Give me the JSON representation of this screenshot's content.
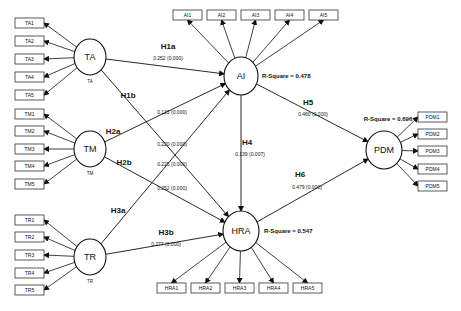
{
  "diagram": {
    "type": "structural-equation-model",
    "constructs": [
      {
        "id": "TA",
        "label": "TA",
        "sublabel": "TA",
        "cx": 90,
        "cy": 57,
        "rx": 16,
        "ry": 18
      },
      {
        "id": "TM",
        "label": "TM",
        "sublabel": "TM",
        "cx": 90,
        "cy": 149,
        "rx": 16,
        "ry": 18
      },
      {
        "id": "TR",
        "label": "TR",
        "sublabel": "TR",
        "cx": 90,
        "cy": 257,
        "rx": 16,
        "ry": 18
      },
      {
        "id": "AI",
        "label": "AI",
        "sublabel": "",
        "cx": 241,
        "cy": 76,
        "rx": 17,
        "ry": 19,
        "r_square": "R-Square = 0.478"
      },
      {
        "id": "HRA",
        "label": "HRA",
        "sublabel": "",
        "cx": 241,
        "cy": 231,
        "rx": 18,
        "ry": 20,
        "r_square": "R-Square = 0.547"
      },
      {
        "id": "PDM",
        "label": "PDM",
        "sublabel": "",
        "cx": 384,
        "cy": 150,
        "rx": 18,
        "ry": 19,
        "r_square": "R-Square = 0.696"
      }
    ],
    "indicators": {
      "TA": [
        "TA1",
        "TA2",
        "TA3",
        "TA4",
        "TA5"
      ],
      "TM": [
        "TM1",
        "TM2",
        "TM3",
        "TM4",
        "TM5"
      ],
      "TR": [
        "TR1",
        "TR2",
        "TR3",
        "TR4",
        "TR5"
      ],
      "AI": [
        "AI1",
        "AI2",
        "AI3",
        "AI4",
        "AI5"
      ],
      "HRA": [
        "HRA1",
        "HRA2",
        "HRA3",
        "HRA4",
        "HRA5"
      ],
      "PDM": [
        "PDM1",
        "PDM2",
        "PDM3",
        "PDM4",
        "PDM5"
      ]
    },
    "paths": [
      {
        "id": "H1a",
        "from": "TA",
        "to": "AI",
        "label": "H1a",
        "coef": "0.252 (0.000)"
      },
      {
        "id": "H1b",
        "from": "TA",
        "to": "HRA",
        "label": "H1b",
        "coef": "0.220 (0.000)"
      },
      {
        "id": "H2a",
        "from": "TM",
        "to": "AI",
        "label": "H2a",
        "coef": "0.133 (0.000)"
      },
      {
        "id": "H2b",
        "from": "TM",
        "to": "HRA",
        "label": "H2b",
        "coef": "0.252 (0.000)"
      },
      {
        "id": "H3a",
        "from": "TR",
        "to": "AI",
        "label": "H3a",
        "coef": "0.225 (0.000)"
      },
      {
        "id": "H3b",
        "from": "TR",
        "to": "HRA",
        "label": "H3b",
        "coef": "0.277 (0.000)"
      },
      {
        "id": "H4",
        "from": "AI",
        "to": "HRA",
        "label": "H4",
        "coef": "0.139 (0.007)"
      },
      {
        "id": "H5",
        "from": "AI",
        "to": "PDM",
        "label": "H5",
        "coef": "0.460 (0.000)"
      },
      {
        "id": "H6",
        "from": "HRA",
        "to": "PDM",
        "label": "H6",
        "coef": "0.479 (0.000)"
      }
    ]
  },
  "colors": {
    "stroke": "#111111",
    "background": "#ffffff",
    "box_border": "#333333"
  }
}
